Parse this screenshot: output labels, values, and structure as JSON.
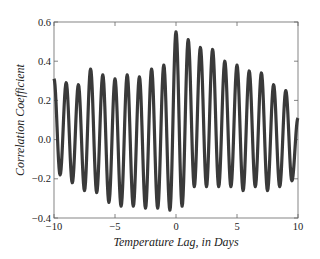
{
  "chart_data": {
    "type": "line",
    "title": "",
    "xlabel": "Temperature Lag, in Days",
    "ylabel": "Correlation Coefficient",
    "xlim": [
      -10,
      10
    ],
    "ylim": [
      -0.4,
      0.6
    ],
    "xticks": [
      -10,
      -5,
      0,
      5,
      10
    ],
    "xtick_labels": [
      "−10",
      "−5",
      "0",
      "5",
      "10"
    ],
    "yticks": [
      -0.4,
      -0.2,
      0.0,
      0.2,
      0.4,
      0.6
    ],
    "ytick_labels": [
      "−0.4",
      "−0.2",
      "0.0",
      "0.2",
      "0.4",
      "0.6"
    ],
    "grid": false,
    "legend": null,
    "series": [
      {
        "name": "correlation",
        "color": "#3a3a3a",
        "period_days": 0.98,
        "extrema": {
          "x": [
            -10.0,
            -9.5,
            -9.0,
            -8.5,
            -8.0,
            -7.5,
            -7.0,
            -6.5,
            -6.0,
            -5.5,
            -5.0,
            -4.5,
            -4.0,
            -3.5,
            -3.0,
            -2.5,
            -2.0,
            -1.5,
            -1.0,
            -0.5,
            0.0,
            0.5,
            1.0,
            1.5,
            2.0,
            2.5,
            3.0,
            3.5,
            4.0,
            4.5,
            5.0,
            5.5,
            6.0,
            6.5,
            7.0,
            7.5,
            8.0,
            8.5,
            9.0,
            9.5,
            10.0
          ],
          "y": [
            0.31,
            -0.18,
            0.29,
            -0.22,
            0.28,
            -0.26,
            0.36,
            -0.27,
            0.33,
            -0.32,
            0.31,
            -0.34,
            0.33,
            -0.34,
            0.32,
            -0.35,
            0.36,
            -0.35,
            0.38,
            -0.36,
            0.55,
            -0.34,
            0.51,
            -0.24,
            0.47,
            -0.24,
            0.46,
            -0.24,
            0.4,
            -0.24,
            0.38,
            -0.26,
            0.35,
            -0.24,
            0.34,
            -0.26,
            0.28,
            -0.24,
            0.25,
            -0.21,
            0.11
          ]
        }
      }
    ]
  }
}
